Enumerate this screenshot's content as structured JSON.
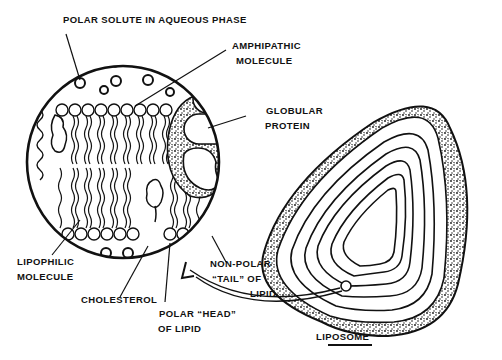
{
  "figure": {
    "colors": {
      "ink": "#111111",
      "background": "#ffffff"
    }
  },
  "labels": {
    "polar_solute": "POLAR SOLUTE IN AQUEOUS PHASE",
    "amphipathic_1": "AMPHIPATHIC",
    "amphipathic_2": "MOLECULE",
    "globular_1": "GLOBULAR",
    "globular_2": "PROTEIN",
    "lipophilic_1": "LIPOPHILIC",
    "lipophilic_2": "MOLECULE",
    "cholesterol": "CHOLESTEROL",
    "polar_head_1": "POLAR “HEAD”",
    "polar_head_2": "OF LIPID",
    "nonpolar_1": "NON-POLAR",
    "nonpolar_2": "“TAIL” OF",
    "nonpolar_3": "LIPID",
    "liposome": "LIPOSOME"
  }
}
